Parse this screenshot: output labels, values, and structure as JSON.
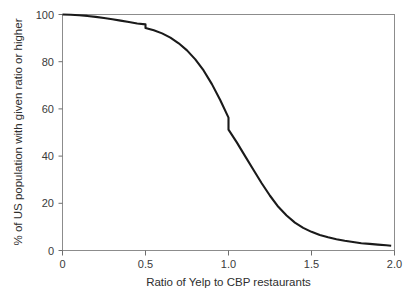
{
  "figure": {
    "background_color": "#ffffff",
    "frame_color": "#8c8c8c",
    "curve_color": "#1a1a1a"
  },
  "axes": {
    "x_title": "Ratio of Yelp to CBP restaurants",
    "y_title": "% of US population with given ratio or higher",
    "x_ticks": [
      "0",
      "0.5",
      "1.0",
      "1.5",
      "2.0"
    ],
    "y_ticks": [
      "0",
      "20",
      "40",
      "60",
      "80",
      "100"
    ]
  },
  "chart_data": {
    "type": "line",
    "title": "",
    "subtitle": "",
    "xlabel": "Ratio of Yelp to CBP restaurants",
    "ylabel": "% of US population with given ratio or higher",
    "xlim": [
      0,
      2.0
    ],
    "ylim": [
      0,
      100
    ],
    "xticks": [
      0,
      0.5,
      1.0,
      1.5,
      2.0
    ],
    "xticklabels": [
      "0",
      "0.5",
      "1.0",
      "1.5",
      "2.0"
    ],
    "yticks": [
      0,
      20,
      40,
      60,
      80,
      100
    ],
    "yticklabels": [
      "0",
      "20",
      "40",
      "60",
      "80",
      "100"
    ],
    "grid": false,
    "legend": false,
    "legend_position": "none",
    "annotations": [
      "Curve is a complementary cumulative distribution (survival) function.",
      "Small downward step near ratio = 0.5.",
      "Pronounced vertical step at ratio = 1.0 dropping from about 56% to 51%."
    ],
    "series": [
      {
        "name": "% of US population with given ratio or higher",
        "x": [
          0.0,
          0.05,
          0.1,
          0.15,
          0.2,
          0.25,
          0.3,
          0.35,
          0.4,
          0.45,
          0.5,
          0.5,
          0.55,
          0.6,
          0.65,
          0.7,
          0.75,
          0.8,
          0.85,
          0.9,
          0.95,
          1.0,
          1.0,
          1.05,
          1.1,
          1.15,
          1.2,
          1.25,
          1.3,
          1.35,
          1.4,
          1.45,
          1.5,
          1.55,
          1.6,
          1.65,
          1.7,
          1.75,
          1.8,
          1.85,
          1.9,
          1.95,
          1.98
        ],
        "y": [
          100.0,
          99.9,
          99.7,
          99.4,
          99.0,
          98.5,
          98.0,
          97.4,
          96.8,
          96.2,
          95.8,
          94.3,
          93.3,
          92.0,
          90.2,
          87.8,
          84.8,
          81.0,
          76.3,
          70.5,
          63.8,
          56.3,
          51.2,
          45.8,
          40.0,
          34.2,
          28.5,
          23.2,
          18.5,
          14.8,
          11.8,
          9.6,
          7.9,
          6.6,
          5.6,
          4.8,
          4.1,
          3.6,
          3.1,
          2.8,
          2.5,
          2.2,
          2.0
        ]
      }
    ]
  }
}
